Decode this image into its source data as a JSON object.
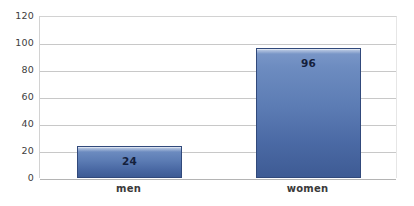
{
  "chart_data": {
    "type": "bar",
    "title": "",
    "subtitle": "",
    "xlabel": "",
    "ylabel": "",
    "categories": [
      "men",
      "women"
    ],
    "values": [
      24,
      96
    ],
    "data_labels": [
      "24",
      "96"
    ],
    "ylim": [
      0,
      120
    ],
    "ytick_values": [
      0,
      20,
      40,
      60,
      80,
      100,
      120
    ],
    "ytick_labels": [
      "0",
      "20",
      "40",
      "60",
      "80",
      "100",
      "120"
    ],
    "grid": true,
    "grid_axis": "y",
    "legend": false,
    "legend_position": "none",
    "series": [
      {
        "name": "",
        "values": [
          24,
          96
        ]
      }
    ],
    "colors": {
      "bar_top": "#7d99c9",
      "bar_bottom": "#3e5b94",
      "bar_border": "#31497b",
      "gridline": "#c8c8c8",
      "baseline": "#b4b4b4",
      "plot_border": "#d2d2d2",
      "tick_label": "#404040",
      "category_label": "#3a3a3a",
      "data_label": "#14203c",
      "background": "#ffffff"
    }
  }
}
